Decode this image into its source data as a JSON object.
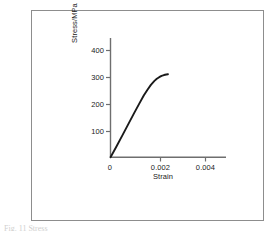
{
  "figure": {
    "frame_color": "#8d8d8d",
    "background": "#ffffff",
    "caption_remnant": "Fig. 11 Stress"
  },
  "chart_data": {
    "type": "line",
    "title": "",
    "xlabel": "Strain",
    "ylabel": "Stress/MPa",
    "xlim": [
      0,
      0.0048
    ],
    "ylim": [
      0,
      440
    ],
    "xticks": [
      0,
      0.002,
      0.004
    ],
    "xticklabels": [
      "0",
      "0.002",
      "0.004"
    ],
    "yticks": [
      100,
      200,
      300,
      400
    ],
    "yticklabels": [
      "100",
      "200",
      "300",
      "400"
    ],
    "grid": false,
    "legend": null,
    "line_color": "#1a1a1a",
    "axis_color": "#6e6e6e",
    "series": [
      {
        "name": "stress-strain curve",
        "x": [
          0.0,
          0.0001,
          0.00025,
          0.0005,
          0.00075,
          0.001,
          0.0012,
          0.0014,
          0.00155,
          0.0017,
          0.00185,
          0.00195,
          0.00205,
          0.00215,
          0.00225,
          0.00235,
          0.00242
        ],
        "y": [
          0,
          16,
          40,
          82,
          124,
          166,
          199,
          231,
          252,
          271,
          286,
          294,
          300,
          305,
          308,
          310,
          311
        ]
      }
    ]
  },
  "annotations": {
    "yaxis_unit": "MPa",
    "curve_endpoint_stress": 311,
    "curve_endpoint_strain": 0.00242
  }
}
